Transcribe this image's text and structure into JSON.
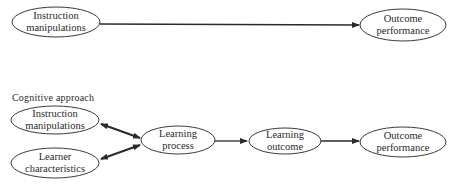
{
  "top_model": {
    "nodes": [
      {
        "id": "instruction",
        "line1": "Instruction",
        "line2": "manipulations"
      },
      {
        "id": "outcome_performance",
        "line1": "Outcome",
        "line2": "performance"
      }
    ],
    "edges": [
      {
        "from": "instruction",
        "to": "outcome_performance",
        "type": "directed"
      }
    ]
  },
  "cognitive_model": {
    "caption": "Cognitive approach",
    "nodes": [
      {
        "id": "instruction",
        "line1": "Instruction",
        "line2": "manipulations"
      },
      {
        "id": "learner",
        "line1": "Learner",
        "line2": "characteristics"
      },
      {
        "id": "learning_process",
        "line1": "Learning",
        "line2": "process"
      },
      {
        "id": "learning_outcome",
        "line1": "Learning",
        "line2": "outcome"
      },
      {
        "id": "outcome_performance",
        "line1": "Outcome",
        "line2": "performance"
      }
    ],
    "edges": [
      {
        "from": "instruction",
        "to": "learning_process",
        "type": "bidirectional"
      },
      {
        "from": "learner",
        "to": "learning_process",
        "type": "bidirectional"
      },
      {
        "from": "learning_process",
        "to": "learning_outcome",
        "type": "directed"
      },
      {
        "from": "learning_outcome",
        "to": "outcome_performance",
        "type": "directed"
      }
    ]
  },
  "colors": {
    "stroke": "#2a2a2a",
    "background": "#ffffff"
  }
}
